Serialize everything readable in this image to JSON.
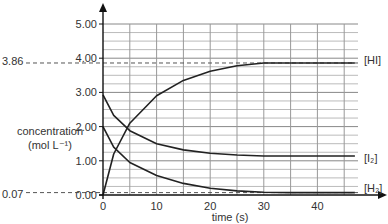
{
  "chart_data": {
    "type": "line",
    "title": "",
    "xlabel": "time (s)",
    "ylabel": "concentration (mol L⁻¹)",
    "xlim": [
      0,
      48
    ],
    "ylim": [
      0,
      5
    ],
    "x_ticks": [
      "0",
      "10",
      "20",
      "30",
      "40"
    ],
    "y_ticks": [
      "0.00",
      "1.00",
      "2.00",
      "3.00",
      "4.00",
      "5.00"
    ],
    "grid": true,
    "reference_lines": [
      {
        "label": "3.86",
        "y": 3.86
      },
      {
        "label": "0.07",
        "y": 0.07
      }
    ],
    "series": [
      {
        "name": "[HI]",
        "x": [
          0,
          2,
          5,
          10,
          15,
          20,
          25,
          30,
          35,
          40,
          47
        ],
        "values": [
          0,
          1.2,
          2.1,
          2.9,
          3.35,
          3.62,
          3.78,
          3.86,
          3.86,
          3.86,
          3.86
        ]
      },
      {
        "name": "[I2]",
        "x": [
          0,
          2,
          5,
          10,
          15,
          20,
          25,
          30,
          35,
          40,
          47
        ],
        "values": [
          2.93,
          2.33,
          1.88,
          1.5,
          1.32,
          1.22,
          1.17,
          1.14,
          1.14,
          1.14,
          1.14
        ]
      },
      {
        "name": "[H2]",
        "x": [
          0,
          2,
          5,
          10,
          15,
          20,
          25,
          30,
          35,
          40,
          47
        ],
        "values": [
          2.0,
          1.4,
          0.95,
          0.57,
          0.34,
          0.2,
          0.12,
          0.08,
          0.07,
          0.07,
          0.07
        ]
      }
    ]
  },
  "labels": {
    "y_axis_line1": "concentration",
    "y_axis_line2": "(mol L⁻¹)",
    "x_axis": "time (s)",
    "ref_high": "3.86",
    "ref_low": "0.07",
    "series_hi": "[HI]",
    "series_i2": "[I₂]",
    "series_h2": "[H₂]"
  }
}
